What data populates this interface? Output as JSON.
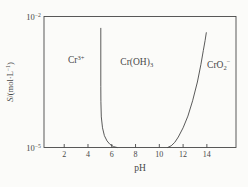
{
  "figure": {
    "background": "#fbfbf9",
    "line_color": "#474747",
    "text_color": "#474747"
  },
  "chart_data": {
    "type": "line",
    "title": "",
    "xlabel": "pH",
    "ylabel": "S/(mol·L⁻¹)",
    "ylabel_segments": [
      {
        "i": "S"
      },
      "/(mol·L",
      {
        "sup": "−1"
      },
      ")"
    ],
    "x_range": [
      0.3,
      16.45
    ],
    "x_ticks": [
      2,
      4,
      6,
      8,
      10,
      12,
      14
    ],
    "y_scale": "log",
    "y_unit": "mol·L⁻¹",
    "y_log_range": [
      -5,
      -2
    ],
    "y_ticks": [
      {
        "value": 0.01,
        "log": -2,
        "label": "10⁻²",
        "segments": [
          "10",
          {
            "sup": "−2"
          }
        ]
      },
      {
        "value": 1e-05,
        "log": -5,
        "label": "10⁻⁵",
        "segments": [
          "10",
          {
            "sup": "−5"
          }
        ]
      }
    ],
    "grid": false,
    "legend": "none",
    "regions": [
      {
        "name": "Cr3+",
        "label": "Cr³⁺",
        "segments": [
          "Cr",
          {
            "sup": "3+"
          }
        ],
        "pH": 3.0,
        "logS": -3.0
      },
      {
        "name": "Cr(OH)3",
        "label": "Cr(OH)₃",
        "segments": [
          "Cr(OH)",
          {
            "sub": "3"
          }
        ],
        "pH": 8.1,
        "logS": -3.05
      },
      {
        "name": "CrO2-",
        "label": "CrO₂⁻",
        "segments": [
          "CrO",
          {
            "sub": "2"
          },
          {
            "sup": "−"
          }
        ],
        "pH": 15.0,
        "logS": -3.1
      }
    ],
    "series": [
      {
        "name": "acid-side dissolution boundary (Cr3+ / Cr(OH)3)",
        "points_format": "[pH, log10(S)]",
        "points": [
          [
            5.08,
            -2.27
          ],
          [
            5.08,
            -3.6
          ],
          [
            5.09,
            -3.95
          ],
          [
            5.12,
            -4.3
          ],
          [
            5.22,
            -4.55
          ],
          [
            5.38,
            -4.73
          ],
          [
            5.6,
            -4.85
          ],
          [
            5.85,
            -4.93
          ],
          [
            6.15,
            -4.98
          ],
          [
            6.45,
            -5.0
          ]
        ]
      },
      {
        "name": "alkaline-side dissolution boundary (Cr(OH)3 / CrO2-)",
        "points_format": "[pH, log10(S)]",
        "points": [
          [
            10.7,
            -5.0
          ],
          [
            11.0,
            -4.96
          ],
          [
            11.3,
            -4.88
          ],
          [
            11.6,
            -4.76
          ],
          [
            12.0,
            -4.55
          ],
          [
            12.4,
            -4.28
          ],
          [
            12.8,
            -3.93
          ],
          [
            13.2,
            -3.5
          ],
          [
            13.5,
            -3.1
          ],
          [
            13.7,
            -2.78
          ],
          [
            13.85,
            -2.55
          ],
          [
            13.95,
            -2.37
          ]
        ]
      }
    ]
  }
}
